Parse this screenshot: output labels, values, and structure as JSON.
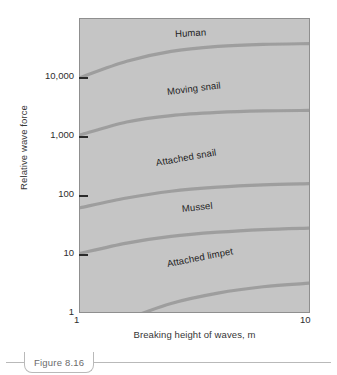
{
  "figure": {
    "caption": "Figure 8.16"
  },
  "chart_data": {
    "type": "line",
    "title": "",
    "xlabel": "Breaking height of waves, m",
    "ylabel": "Relative wave force",
    "xscale": "log",
    "yscale": "log",
    "xlim": [
      1,
      10
    ],
    "ylim": [
      1,
      100000
    ],
    "grid": false,
    "legend_position": "inline-curve-labels",
    "xticks": [
      {
        "value": 1,
        "label": "1"
      },
      {
        "value": 10,
        "label": "10"
      }
    ],
    "yticks": [
      {
        "value": 1,
        "label": "1"
      },
      {
        "value": 10,
        "label": "10"
      },
      {
        "value": 100,
        "label": "100"
      },
      {
        "value": 1000,
        "label": "1,000"
      },
      {
        "value": 10000,
        "label": "10,000"
      }
    ],
    "x": [
      1,
      1.6,
      2.5,
      4,
      6.3,
      10
    ],
    "series": [
      {
        "name": "Human",
        "label": "Human",
        "values": [
          10000,
          19000,
          28000,
          34000,
          37000,
          38000
        ],
        "color": "#9a9a9a"
      },
      {
        "name": "Moving snail",
        "label": "Moving snail",
        "values": [
          1050,
          1750,
          2250,
          2550,
          2700,
          2750
        ],
        "color": "#9a9a9a"
      },
      {
        "name": "Attached snail",
        "label": "Attached snail",
        "values": [
          60,
          88,
          115,
          135,
          148,
          155
        ],
        "color": "#9a9a9a"
      },
      {
        "name": "Mussel",
        "label": "Mussel",
        "values": [
          10,
          15,
          19.5,
          23,
          25.5,
          27
        ],
        "color": "#9a9a9a"
      },
      {
        "name": "Attached limpet",
        "label": "Attached limpet",
        "values": [
          0.35,
          0.75,
          1.4,
          2.1,
          2.7,
          3.1
        ],
        "color": "#9a9a9a"
      }
    ],
    "annotations": [
      {
        "text": "Human",
        "x": 2.6,
        "y": 52000,
        "rotation": -3
      },
      {
        "text": "Moving snail",
        "x": 2.4,
        "y": 5400,
        "rotation": -7
      },
      {
        "text": "Attached snail",
        "x": 2.15,
        "y": 330,
        "rotation": -10
      },
      {
        "text": "Mussel",
        "x": 2.8,
        "y": 56,
        "rotation": -6
      },
      {
        "text": "Attached limpet",
        "x": 2.4,
        "y": 6.4,
        "rotation": -11
      }
    ]
  },
  "colors": {
    "plot_background": "#c5c5c5",
    "plot_border": "#8f8f8f",
    "curve": "#9a9a9a",
    "tick_text": "#2e2e2e",
    "axis_title": "#363636",
    "caption_text": "#6b6b6b",
    "caption_rule": "#b9b9b9"
  }
}
